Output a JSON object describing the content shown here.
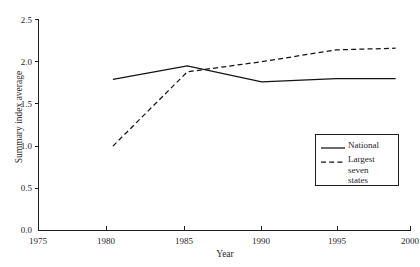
{
  "chart_data": {
    "type": "line",
    "title": "",
    "xlabel": "Year",
    "ylabel": "Summary index average",
    "xlim": [
      1975,
      2000
    ],
    "ylim": [
      0.0,
      2.5
    ],
    "grid": false,
    "legend_position": "center-right",
    "x_ticks": [
      1975,
      1980,
      1985,
      1990,
      1995,
      2000
    ],
    "x_tick_labels": [
      "1975",
      "1980",
      "1985",
      "1990",
      "1995",
      "2000"
    ],
    "y_ticks": [
      0.0,
      0.5,
      1.0,
      1.5,
      2.0,
      2.5
    ],
    "y_tick_labels": [
      "0.0",
      "0.5",
      "1.0",
      "1.5",
      "2.0",
      "2.5"
    ],
    "x": [
      1980,
      1985,
      1990,
      1995,
      1999
    ],
    "series": [
      {
        "name": "National",
        "style": "solid",
        "color": "#131313",
        "values": [
          1.79,
          1.95,
          1.76,
          1.8,
          1.8
        ]
      },
      {
        "name": "Largest\nseven\nstates",
        "style": "dashed",
        "color": "#131313",
        "values": [
          1.0,
          1.88,
          2.0,
          2.14,
          2.16
        ]
      }
    ]
  },
  "legend": {
    "items": [
      {
        "label": "National",
        "style": "solid"
      },
      {
        "label": "Largest\nseven\nstates",
        "style": "dashed"
      }
    ]
  },
  "axes": {
    "x_title": "Year",
    "y_title": "Summary index average"
  }
}
